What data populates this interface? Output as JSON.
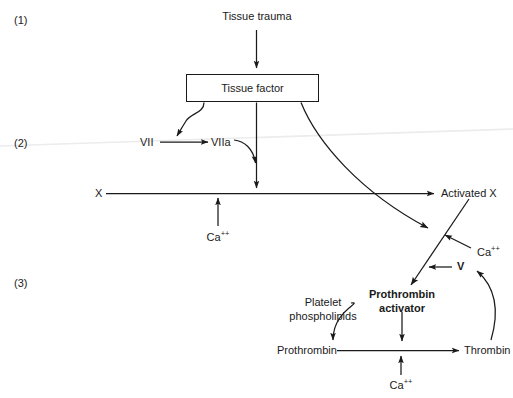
{
  "figure": {
    "title_present": false,
    "background_color": "#ffffff",
    "stroke_color": "#1a1a1a",
    "artifact_line_color": "#ececed"
  },
  "stages": [
    {
      "id": "stage-1",
      "label": "(1)",
      "x": 14,
      "y": 14
    },
    {
      "id": "stage-2",
      "label": "(2)",
      "x": 14,
      "y": 137
    },
    {
      "id": "stage-3",
      "label": "(3)",
      "x": 14,
      "y": 277
    }
  ],
  "nodes": {
    "tissue_trauma": {
      "label": "Tissue trauma",
      "x": 257,
      "y": 10
    },
    "tissue_factor": {
      "label": "Tissue factor",
      "x": 186,
      "y": 74,
      "w": 133,
      "h": 28
    },
    "factor_vii": {
      "label": "VII",
      "x": 146,
      "y": 138
    },
    "factor_viia": {
      "label": "VIIa",
      "x": 216,
      "y": 138
    },
    "factor_x": {
      "label": "X",
      "x": 97,
      "y": 187
    },
    "activated_x": {
      "label": "Activated X",
      "x": 441,
      "y": 187
    },
    "calcium_x": {
      "label": "Ca",
      "sup": "++",
      "x": 205,
      "y": 231
    },
    "calcium_activator": {
      "label": "Ca",
      "sup": "++",
      "x": 477,
      "y": 246
    },
    "factor_v": {
      "label": "V",
      "x": 458,
      "y": 262
    },
    "platelet_phospholipids_line1": {
      "label": "Platelet",
      "x": 323,
      "y": 296
    },
    "platelet_phospholipids_line2": {
      "label": "phospholipids",
      "x": 323,
      "y": 310
    },
    "prothrombin_activator_line1": {
      "label": "Prothrombin",
      "x": 402,
      "y": 288
    },
    "prothrombin_activator_line2": {
      "label": "activator",
      "x": 402,
      "y": 303
    },
    "prothrombin": {
      "label": "Prothrombin",
      "x": 277,
      "y": 344
    },
    "thrombin": {
      "label": "Thrombin",
      "x": 464,
      "y": 344
    },
    "calcium_prothrombin": {
      "label": "Ca",
      "sup": "++",
      "x": 389,
      "y": 380
    }
  },
  "edges": [
    {
      "name": "tissue-trauma-to-tissue-factor",
      "from": "Tissue trauma",
      "to": "Tissue factor",
      "kind": "straight-arrow-down"
    },
    {
      "name": "tissue-factor-to-vii-viia",
      "from": "Tissue factor",
      "to": "VII to VIIa conversion",
      "kind": "curved-arrow-down-left"
    },
    {
      "name": "vii-to-viia",
      "from": "VII",
      "to": "VIIa",
      "kind": "straight-arrow-right"
    },
    {
      "name": "tissue-factor-to-x-line",
      "from": "Tissue factor",
      "to": "X to Activated X line",
      "kind": "straight-arrow-down"
    },
    {
      "name": "viia-to-x-line",
      "from": "VIIa",
      "to": "X to Activated X line",
      "kind": "curved-arrow-down"
    },
    {
      "name": "x-to-activated-x",
      "from": "X",
      "to": "Activated X",
      "kind": "straight-arrow-right"
    },
    {
      "name": "calcium-to-x-line",
      "from": "Ca++",
      "to": "X to Activated X line",
      "kind": "straight-arrow-up"
    },
    {
      "name": "tissue-factor-to-prothrombin-activator",
      "from": "Tissue factor",
      "to": "Prothrombin activator pathway",
      "kind": "long-curved-arrow-down-right"
    },
    {
      "name": "activated-x-to-prothrombin-activator",
      "from": "Activated X",
      "to": "Prothrombin activator",
      "kind": "diagonal-arrow-down-left"
    },
    {
      "name": "calcium-to-activator-diagonal",
      "from": "Ca++",
      "to": "Prothrombin activator pathway",
      "kind": "straight-arrow-up-left"
    },
    {
      "name": "v-to-activator-diagonal",
      "from": "V",
      "to": "Prothrombin activator pathway",
      "kind": "straight-arrow-left"
    },
    {
      "name": "thrombin-to-v",
      "from": "Thrombin",
      "to": "V",
      "kind": "curved-feedback-arrow-up"
    },
    {
      "name": "platelet-phospholipids-to-prothrombin-line",
      "from": "Platelet phospholipids",
      "to": "Prothrombin to Thrombin line",
      "kind": "curved-arrow-down-right"
    },
    {
      "name": "prothrombin-activator-to-prothrombin-line",
      "from": "Prothrombin activator",
      "to": "Prothrombin to Thrombin line",
      "kind": "straight-arrow-down"
    },
    {
      "name": "prothrombin-to-thrombin",
      "from": "Prothrombin",
      "to": "Thrombin",
      "kind": "straight-arrow-right"
    },
    {
      "name": "calcium-to-prothrombin-line",
      "from": "Ca++",
      "to": "Prothrombin to Thrombin line",
      "kind": "straight-arrow-up"
    }
  ]
}
